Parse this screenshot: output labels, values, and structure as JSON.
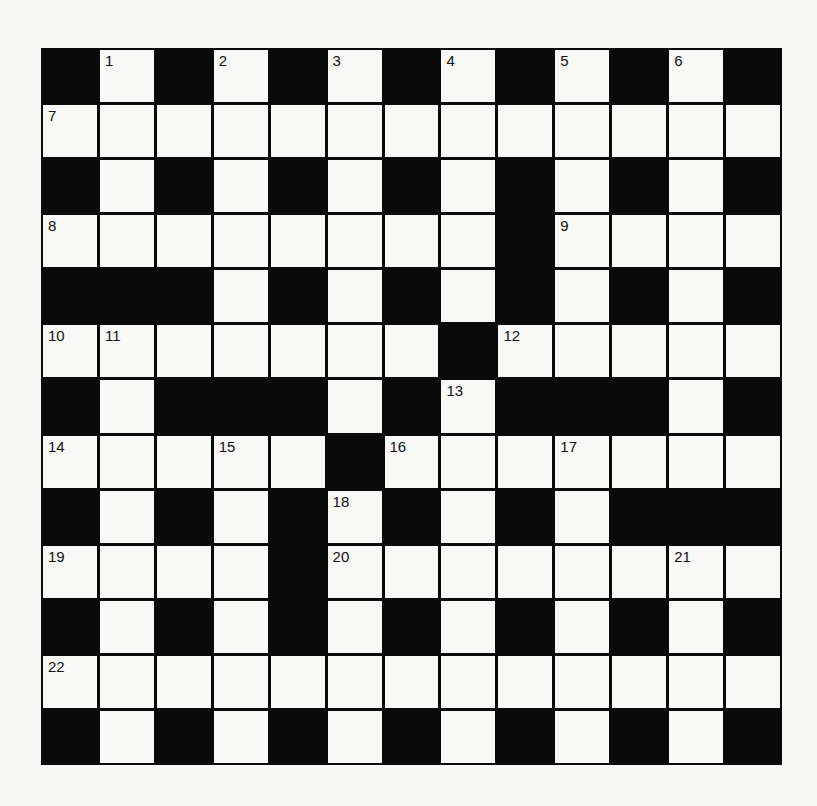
{
  "puzzle": {
    "rows": 13,
    "cols": 13,
    "colors": {
      "block": "#0a0a0a",
      "cell": "#f8f8f6",
      "background": "#f7f7f5",
      "number": "#111111"
    },
    "grid": [
      "#.#.#.#.#.#.#",
      ".............",
      "#.#.#.#.#.#.#",
      "........#....",
      "###.#.#.#.#.#",
      ".......#.....",
      "#.###.#.####.#",
      ".....#.......",
      "#.#.#.#.#.###",
      "....#........",
      "#.#.#.#.#.#.#",
      ".............",
      "#.#.#.#.#.#.#"
    ],
    "numbers": [
      {
        "n": "1",
        "row": 0,
        "col": 1
      },
      {
        "n": "2",
        "row": 0,
        "col": 3
      },
      {
        "n": "3",
        "row": 0,
        "col": 5
      },
      {
        "n": "4",
        "row": 0,
        "col": 7
      },
      {
        "n": "5",
        "row": 0,
        "col": 9
      },
      {
        "n": "6",
        "row": 0,
        "col": 11
      },
      {
        "n": "7",
        "row": 1,
        "col": 0
      },
      {
        "n": "8",
        "row": 3,
        "col": 0
      },
      {
        "n": "9",
        "row": 3,
        "col": 9
      },
      {
        "n": "10",
        "row": 5,
        "col": 0
      },
      {
        "n": "11",
        "row": 5,
        "col": 1
      },
      {
        "n": "12",
        "row": 5,
        "col": 8
      },
      {
        "n": "13",
        "row": 6,
        "col": 7
      },
      {
        "n": "14",
        "row": 7,
        "col": 0
      },
      {
        "n": "15",
        "row": 7,
        "col": 3
      },
      {
        "n": "16",
        "row": 7,
        "col": 6
      },
      {
        "n": "17",
        "row": 7,
        "col": 9
      },
      {
        "n": "18",
        "row": 8,
        "col": 5
      },
      {
        "n": "19",
        "row": 9,
        "col": 0
      },
      {
        "n": "20",
        "row": 9,
        "col": 5
      },
      {
        "n": "21",
        "row": 9,
        "col": 11
      },
      {
        "n": "22",
        "row": 11,
        "col": 0
      }
    ]
  }
}
